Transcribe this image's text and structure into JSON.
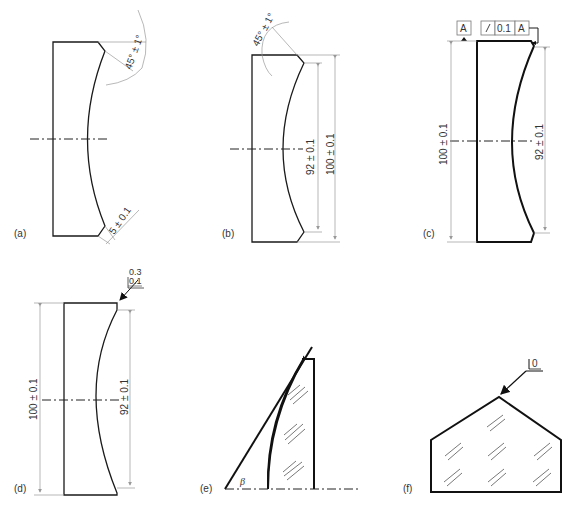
{
  "figure": {
    "panels": [
      {
        "id": "a",
        "label": "(a)",
        "annotations": [
          "45° ± 1°",
          "5 ± 0.1"
        ]
      },
      {
        "id": "b",
        "label": "(b)",
        "annotations": [
          "45° ± 1°",
          "92 ± 0.1",
          "100 ± 0.1"
        ]
      },
      {
        "id": "c",
        "label": "(c)",
        "annotations": [
          "100 ± 0.1",
          "92 ± 0.1"
        ],
        "datum": "A",
        "tolerance_frame": {
          "symbol": "circular-runout",
          "value": "0.1",
          "datum": "A"
        }
      },
      {
        "id": "d",
        "label": "(d)",
        "annotations": [
          "100 ± 0.1",
          "92 ± 0.1"
        ],
        "surface_note": {
          "top": "0.3",
          "bottom": "0.1"
        }
      },
      {
        "id": "e",
        "label": "(e)",
        "annotations": [
          "β"
        ]
      },
      {
        "id": "f",
        "label": "(f)",
        "annotations": [
          "0"
        ]
      }
    ]
  },
  "a": {
    "label": "(a)",
    "angle": "45° ± 1°",
    "chamfer": "5 ± 0.1"
  },
  "b": {
    "label": "(b)",
    "angle": "45° ± 1°",
    "inner": "92 ± 0.1",
    "outer": "100 ± 0.1"
  },
  "c": {
    "label": "(c)",
    "datum": "A",
    "tol_value": "0.1",
    "tol_datum": "A",
    "outer": "100 ± 0.1",
    "inner": "92 ± 0.1"
  },
  "d": {
    "label": "(d)",
    "surf_top": "0.3",
    "surf_bottom": "0.1",
    "outer": "100 ± 0.1",
    "inner": "92 ± 0.1"
  },
  "e": {
    "label": "(e)",
    "angle_symbol": "β"
  },
  "f": {
    "label": "(f)",
    "surf_value": "0"
  }
}
